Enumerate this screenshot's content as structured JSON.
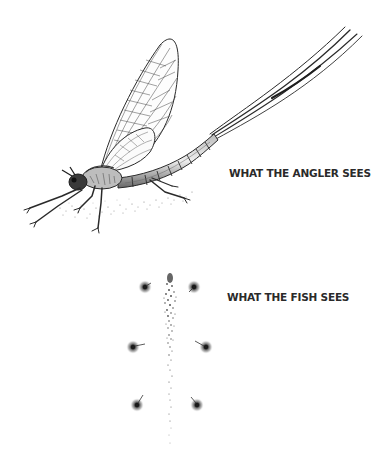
{
  "illustration": {
    "subject": "mayfly",
    "captions": {
      "angler_view": "WHAT THE ANGLER SEES",
      "fish_view": "WHAT THE FISH SEES"
    },
    "fish_view_features": {
      "footprints_count": 6,
      "body_imprint": "stippled vertical line"
    }
  },
  "colors": {
    "ink": "#2a2a2a",
    "background": "#ffffff"
  }
}
